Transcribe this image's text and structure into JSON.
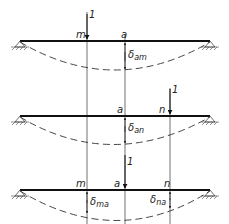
{
  "diagram": {
    "colors": {
      "line": "#111111",
      "background": "#ffffff"
    },
    "beams": [
      {
        "id": "beam-1",
        "load_label": "1",
        "load_at": "m",
        "points": {
          "m": "m",
          "a": "a"
        },
        "deflection_label": "δ",
        "deflection_sub": "am"
      },
      {
        "id": "beam-2",
        "load_label": "1",
        "load_at": "n",
        "points": {
          "a": "a",
          "n": "n"
        },
        "deflection_label": "δ",
        "deflection_sub": "an"
      },
      {
        "id": "beam-3",
        "load_label": "1",
        "load_at": "a",
        "points": {
          "m": "m",
          "a": "a",
          "n": "n"
        },
        "deflections": [
          {
            "label": "δ",
            "sub": "ma"
          },
          {
            "label": "δ",
            "sub": "na"
          }
        ]
      }
    ]
  }
}
